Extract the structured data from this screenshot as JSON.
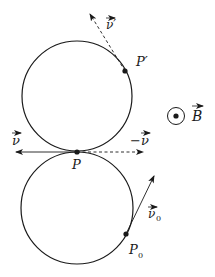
{
  "diagram": {
    "colors": {
      "stroke": "#1a1a1a",
      "background": "#ffffff"
    },
    "upper_circle": {
      "cx": 77,
      "cy": 96,
      "r": 55
    },
    "lower_circle": {
      "cx": 77,
      "cy": 208,
      "r": 56
    },
    "points": {
      "P": {
        "label": "P",
        "x": 77,
        "y": 152
      },
      "P_prime": {
        "label": "P′",
        "x": 125,
        "y": 71
      },
      "P0": {
        "label": "P",
        "subscript": "0",
        "x": 126,
        "y": 234
      }
    },
    "vectors": {
      "v": {
        "label": "ν",
        "style": "solid"
      },
      "minus_v": {
        "label": "−ν",
        "style": "dashed"
      },
      "v_prime": {
        "label": "ν′",
        "style": "dashed"
      },
      "v0": {
        "label": "ν",
        "subscript": "0",
        "style": "solid"
      }
    },
    "field": {
      "label": "B",
      "symbol": "dot-in-circle (out of page)"
    }
  }
}
